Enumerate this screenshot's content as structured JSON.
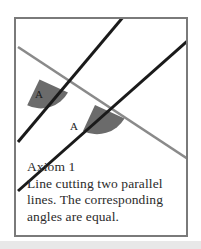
{
  "figure": {
    "border_color": "#7a7a7a",
    "background": "#ffffff",
    "bottom_strip_color": "#e8e8e8",
    "angle_fill_color": "#6b6b6b",
    "transversal_color": "#8a8a8a",
    "parallel_line_color": "#1a1a1a",
    "angle_labels": [
      {
        "text": "A",
        "position": "upper-left-angle"
      },
      {
        "text": "A",
        "position": "lower-right-angle"
      }
    ]
  },
  "caption": {
    "title": "Axiom 1",
    "lines": [
      "Line cutting two parallel",
      "lines. The corresponding",
      "angles are equal."
    ]
  }
}
